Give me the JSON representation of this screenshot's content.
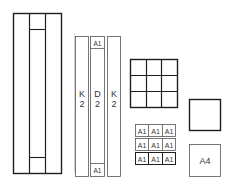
{
  "diagram": {
    "tall_frame": {
      "label": ""
    },
    "strips": [
      {
        "id": "left-strip",
        "label_line1": "K",
        "label_line2": "2"
      },
      {
        "id": "center-strip",
        "label_line1": "D",
        "label_line2": "2",
        "top_cell": "A1",
        "bottom_cell": "A1"
      },
      {
        "id": "right-strip",
        "label_line1": "K",
        "label_line2": "2"
      }
    ],
    "grid_3x3": {
      "rows": 3,
      "cols": 3
    },
    "square": {
      "label": ""
    },
    "a1_grid": {
      "rows": [
        [
          "A1",
          "A1",
          "A1"
        ],
        [
          "A1",
          "A1",
          "A1"
        ],
        [
          "A1",
          "A1",
          "A1"
        ]
      ]
    },
    "a4_box": {
      "label": "A4"
    }
  }
}
